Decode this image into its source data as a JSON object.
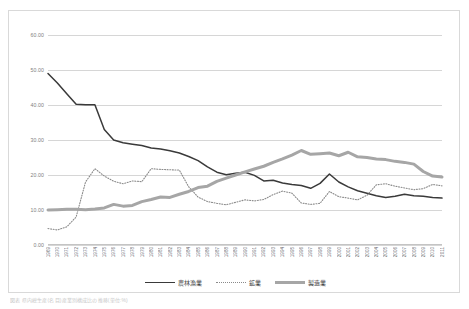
{
  "figure": {
    "caption": "図表 県内総生産(名目)産業別構成比の推移(単位:%)"
  },
  "legend": {
    "position": "bottom",
    "items": [
      {
        "label": "農林漁業",
        "style": "solid",
        "color": "#3a3a3a"
      },
      {
        "label": "鉱業",
        "style": "dotted",
        "color": "#8a8a8a"
      },
      {
        "label": "製造業",
        "style": "thick",
        "color": "#a6a6a6"
      }
    ]
  },
  "chart_data": {
    "type": "line",
    "title": "",
    "xlabel": "",
    "ylabel": "",
    "ylim": [
      0,
      60
    ],
    "yticks": [
      0,
      10,
      20,
      30,
      40,
      50,
      60
    ],
    "ytick_labels": [
      "0.00",
      "10.00",
      "20.00",
      "30.00",
      "40.00",
      "50.00",
      "60.00"
    ],
    "grid": true,
    "categories": [
      "1969",
      "1970",
      "1971",
      "1972",
      "1973",
      "1974",
      "1975",
      "1976",
      "1977",
      "1978",
      "1979",
      "1980",
      "1981",
      "1982",
      "1983",
      "1984",
      "1985",
      "1986",
      "1987",
      "1988",
      "1989",
      "1990",
      "1991",
      "1992",
      "1993",
      "1994",
      "1995",
      "1996",
      "1997",
      "1998",
      "1999",
      "2000",
      "2001",
      "2002",
      "2003",
      "2004",
      "2005",
      "2006",
      "2007",
      "2008",
      "2009",
      "2010",
      "2011"
    ],
    "series": [
      {
        "name": "農林漁業",
        "color": "#3a3a3a",
        "style": "solid",
        "values": [
          49.0,
          46.3,
          43.2,
          40.2,
          40.1,
          40.1,
          33.0,
          30.0,
          29.2,
          28.8,
          28.4,
          27.7,
          27.4,
          26.9,
          26.3,
          25.3,
          24.1,
          22.3,
          20.8,
          20.1,
          20.5,
          20.8,
          19.9,
          18.3,
          18.5,
          17.7,
          17.3,
          17.0,
          16.2,
          17.6,
          20.3,
          18.0,
          16.6,
          15.5,
          14.8,
          14.1,
          13.6,
          13.9,
          14.5,
          14.1,
          13.9,
          13.6,
          13.4
        ]
      },
      {
        "name": "鉱業",
        "color": "#8a8a8a",
        "style": "dotted",
        "values": [
          4.7,
          4.3,
          5.2,
          8.0,
          18.0,
          21.8,
          19.7,
          18.2,
          17.5,
          18.3,
          18.1,
          21.8,
          21.6,
          21.5,
          21.4,
          16.6,
          13.7,
          12.4,
          11.9,
          11.5,
          12.2,
          12.9,
          12.6,
          13.0,
          14.4,
          15.4,
          14.8,
          12.0,
          11.6,
          11.9,
          15.3,
          13.8,
          13.4,
          12.9,
          14.2,
          17.2,
          17.5,
          16.8,
          16.3,
          15.8,
          16.1,
          17.3,
          16.9
        ]
      },
      {
        "name": "製造業",
        "color": "#a6a6a6",
        "style": "thick",
        "values": [
          10.0,
          10.1,
          10.2,
          10.2,
          10.1,
          10.3,
          10.6,
          11.6,
          11.1,
          11.3,
          12.4,
          13.0,
          13.7,
          13.6,
          14.5,
          15.3,
          16.4,
          16.8,
          18.2,
          19.1,
          20.0,
          20.9,
          21.7,
          22.5,
          23.6,
          24.6,
          25.7,
          27.0,
          25.9,
          26.1,
          26.3,
          25.5,
          26.5,
          25.2,
          25.0,
          24.6,
          24.4,
          23.9,
          23.6,
          23.1,
          21.0,
          19.7,
          19.4
        ]
      }
    ]
  }
}
